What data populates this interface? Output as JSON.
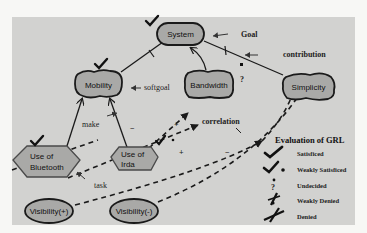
{
  "colors": {
    "panel_background": "#d2d2d0",
    "page_background": "#f7f7f5",
    "node_fill": "#a9a9a7",
    "stroke": "#1a1a1a"
  },
  "nodes": {
    "system": {
      "label": "System",
      "type": "softgoal-rounded",
      "evaluation": "satisficed"
    },
    "mobility": {
      "label": "Mobility",
      "type": "softgoal",
      "evaluation": "satisficed"
    },
    "bandwidth": {
      "label": "Bandwidth",
      "type": "softgoal",
      "evaluation": "none"
    },
    "simplicity": {
      "label": "Simplicity",
      "type": "softgoal",
      "evaluation": "none"
    },
    "use_of_bluetooth": {
      "label_line1": "Use of",
      "label_line2": "Bluetooth",
      "type": "task",
      "evaluation": "satisficed"
    },
    "use_of_irda": {
      "label_line1": "Use of",
      "label_line2": "Irda",
      "type": "task",
      "evaluation": "weakly-satisficed"
    },
    "visibility_plus": {
      "label": "Visibility(+)",
      "type": "ellipse"
    },
    "visibility_minus": {
      "label": "Visibility(-)",
      "type": "ellipse"
    }
  },
  "annotations": {
    "goal": "Goal",
    "contribution": "contribution",
    "softgoal": "softgoal",
    "make": "make",
    "correlation": "correlation",
    "task": "task"
  },
  "contribution_marks": {
    "bandwidth_simplicity_question": "?",
    "mobility_bluetooth_irda_link": "−",
    "irda_bandwidth_plus": "+",
    "visibility_plus_plus": "+",
    "visibility_minus_minus": "−"
  },
  "legend": {
    "title": "Evaluation of GRL",
    "items": [
      {
        "icon": "check-icon",
        "label": "Satisficed"
      },
      {
        "icon": "weak-check-icon",
        "label": "Weakly Satisficed"
      },
      {
        "icon": "question-icon",
        "label": "Undecided"
      },
      {
        "icon": "weak-cross-icon",
        "label": "Weakly Denied"
      },
      {
        "icon": "cross-icon",
        "label": "Denied"
      }
    ]
  }
}
